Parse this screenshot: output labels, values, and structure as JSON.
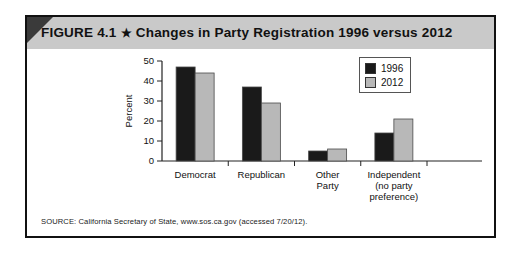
{
  "figure": {
    "label": "FIGURE 4.1",
    "star": "★",
    "title": "Changes in Party Registration 1996 versus 2012",
    "source": "SOURCE: California Secretary of State, www.sos.ca.gov (accessed 7/20/12)."
  },
  "legend": {
    "items": [
      {
        "label": "1996",
        "color": "#1a1a1a"
      },
      {
        "label": "2012",
        "color": "#b8b8b8"
      }
    ]
  },
  "axis": {
    "y_title": "Percent",
    "y_ticks": [
      "0",
      "10",
      "20",
      "30",
      "40",
      "50"
    ]
  },
  "categories_display": [
    [
      "Democrat"
    ],
    [
      "Republican"
    ],
    [
      "Other",
      "Party"
    ],
    [
      "Independent",
      "(no party",
      "preference)"
    ]
  ],
  "chart_data": {
    "type": "bar",
    "title": "Changes in Party Registration 1996 versus 2012",
    "xlabel": "",
    "ylabel": "Percent",
    "ylim": [
      0,
      50
    ],
    "yticks": [
      0,
      10,
      20,
      30,
      40,
      50
    ],
    "grid": false,
    "legend_position": "top-right",
    "categories": [
      "Democrat",
      "Republican",
      "Other Party",
      "Independent (no party preference)"
    ],
    "series": [
      {
        "name": "1996",
        "color": "#1a1a1a",
        "values": [
          47,
          37,
          5,
          14
        ]
      },
      {
        "name": "2012",
        "color": "#b8b8b8",
        "values": [
          44,
          29,
          6,
          21
        ]
      }
    ]
  }
}
